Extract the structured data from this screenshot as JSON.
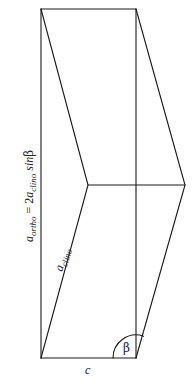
{
  "diagram": {
    "labels": {
      "vertical_relation": {
        "lhs_base": "a",
        "lhs_sub": "ortho",
        "equals": " = 2",
        "rhs_base": "a",
        "rhs_sub": "clino",
        "rhs_tail": " sin",
        "angle": "β"
      },
      "slanted_edge": {
        "base": "a",
        "sub": "clino"
      },
      "bottom_edge": "c",
      "angle": "β"
    },
    "colors": {
      "line": "#1a1a1a",
      "text": "#222222",
      "background": "#ffffff"
    }
  }
}
